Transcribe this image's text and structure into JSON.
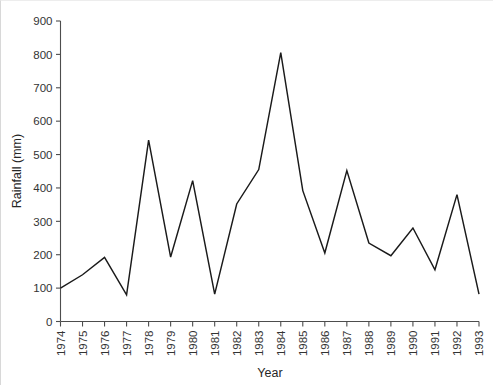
{
  "chart_data": {
    "type": "line",
    "title": "",
    "subtitle": "",
    "xlabel": "Year",
    "ylabel": "Rainfall (mm)",
    "xlim": [
      1974,
      1993
    ],
    "ylim": [
      0,
      900
    ],
    "grid": false,
    "legend": false,
    "legend_position": "none",
    "line_color": "#1a1a1a",
    "categories": [
      "1974",
      "1975",
      "1976",
      "1977",
      "1978",
      "1979",
      "1980",
      "1981",
      "1982",
      "1983",
      "1984",
      "1985",
      "1986",
      "1987",
      "1988",
      "1989",
      "1990",
      "1991",
      "1992",
      "1993"
    ],
    "x": [
      1974,
      1975,
      1976,
      1977,
      1978,
      1979,
      1980,
      1981,
      1982,
      1983,
      1984,
      1985,
      1986,
      1987,
      1988,
      1989,
      1990,
      1991,
      1992,
      1993
    ],
    "values": [
      100,
      140,
      192,
      80,
      543,
      193,
      422,
      82,
      352,
      455,
      805,
      392,
      205,
      452,
      235,
      197,
      280,
      155,
      380,
      82
    ],
    "series": [
      {
        "name": "Rainfall",
        "values": [
          100,
          140,
          192,
          80,
          543,
          193,
          422,
          82,
          352,
          455,
          805,
          392,
          205,
          452,
          235,
          197,
          280,
          155,
          380,
          82
        ]
      }
    ],
    "y_ticks": [
      0,
      100,
      200,
      300,
      400,
      500,
      600,
      700,
      800,
      900
    ],
    "y_tick_labels": [
      "0",
      "100",
      "200",
      "300",
      "400",
      "500",
      "600",
      "700",
      "800",
      "900"
    ],
    "x_ticks": [
      1974,
      1975,
      1976,
      1977,
      1978,
      1979,
      1980,
      1981,
      1982,
      1983,
      1984,
      1985,
      1986,
      1987,
      1988,
      1989,
      1990,
      1991,
      1992,
      1993
    ],
    "x_tick_labels": [
      "1974",
      "1975",
      "1976",
      "1977",
      "1978",
      "1979",
      "1980",
      "1981",
      "1982",
      "1983",
      "1984",
      "1985",
      "1986",
      "1987",
      "1988",
      "1989",
      "1990",
      "1991",
      "1992",
      "1993"
    ]
  },
  "figure": {
    "background_color": "#ffffff",
    "axis_color": "#4d4d4d",
    "text_color": "#333333"
  }
}
